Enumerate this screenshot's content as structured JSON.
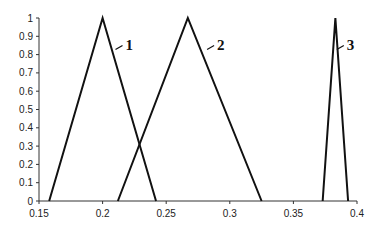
{
  "chart_data": {
    "type": "line",
    "title": "",
    "xlabel": "",
    "ylabel": "",
    "xlim": [
      0.15,
      0.4
    ],
    "ylim": [
      0,
      1
    ],
    "grid": false,
    "legend": "inline labels",
    "x_ticks": [
      "0.15",
      "0.2",
      "0.25",
      "0.3",
      "0.35",
      "0.4"
    ],
    "y_ticks": [
      "0",
      "0.1",
      "0.2",
      "0.3",
      "0.4",
      "0.5",
      "0.6",
      "0.7",
      "0.8",
      "0.9",
      "1"
    ],
    "series": [
      {
        "name": "1",
        "x": [
          0.158,
          0.2,
          0.242
        ],
        "y": [
          0,
          1,
          0
        ]
      },
      {
        "name": "2",
        "x": [
          0.212,
          0.267,
          0.325
        ],
        "y": [
          0,
          1,
          0
        ]
      },
      {
        "name": "3",
        "x": [
          0.373,
          0.383,
          0.393
        ],
        "y": [
          0,
          1,
          0
        ]
      }
    ],
    "annotations": [
      {
        "text": "1",
        "x": 0.218,
        "y": 0.85
      },
      {
        "text": "2",
        "x": 0.29,
        "y": 0.85
      },
      {
        "text": "3",
        "x": 0.392,
        "y": 0.85
      }
    ],
    "line_color": "#111111"
  }
}
